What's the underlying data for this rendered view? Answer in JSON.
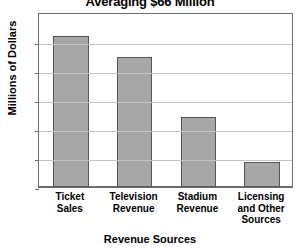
{
  "chart_data": {
    "type": "bar",
    "title": "Averaging $66 Million",
    "xlabel": "Revenue Sources",
    "ylabel": "Millions of Dollars",
    "categories": [
      "Ticket Sales",
      "Television Revenue",
      "Stadium Revenue",
      "Licensing and Other Sources"
    ],
    "category_lines": [
      [
        "Ticket",
        "Sales"
      ],
      [
        "Television",
        "Revenue"
      ],
      [
        "Stadium",
        "Revenue"
      ],
      [
        "Licensing",
        "and Other",
        "Sources"
      ]
    ],
    "values": [
      26,
      22.5,
      12,
      4.3
    ],
    "ylim": [
      0,
      30.2
    ],
    "yticks": [
      0,
      5,
      10,
      15,
      20,
      25
    ],
    "ytick_labels": [
      "0",
      "5",
      "10",
      "15",
      "20",
      "25"
    ],
    "grid": true,
    "legend": null,
    "bar_color": "#a7a7a7",
    "bar_edge_color": "#555555",
    "grid_color": "#c4c4c4",
    "axis_color": "#6e6e6e",
    "plot_background": "#ffffff"
  }
}
